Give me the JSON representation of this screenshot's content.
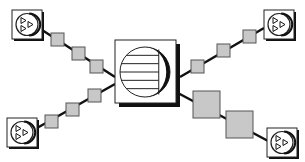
{
  "diagram": {
    "width": 305,
    "height": 162,
    "colors": {
      "background": "#ffffff",
      "line": "#111111",
      "square_fill": "#c8c8c8",
      "square_stroke": "#555555",
      "node_fill": "#ffffff",
      "node_stroke": "#222222",
      "shadow": "#111111"
    },
    "hub": {
      "name": "central-server",
      "icon": "striped-circle-icon",
      "x": 115,
      "y": 40,
      "w": 61,
      "h": 63,
      "shadow_offset": 4,
      "circle": {
        "cx": 145,
        "cy": 72,
        "r": 25
      },
      "stripes": 5
    },
    "nodes": [
      {
        "name": "node-top-left",
        "icon": "triangles-in-circle-icon",
        "x": 12,
        "y": 10,
        "w": 30,
        "h": 29
      },
      {
        "name": "node-top-right",
        "icon": "triangles-in-circle-icon",
        "x": 264,
        "y": 10,
        "w": 30,
        "h": 29
      },
      {
        "name": "node-bottom-left",
        "icon": "triangles-in-circle-icon",
        "x": 7,
        "y": 118,
        "w": 30,
        "h": 29
      },
      {
        "name": "node-bottom-right",
        "icon": "triangles-in-circle-icon",
        "x": 267,
        "y": 128,
        "w": 30,
        "h": 29
      }
    ],
    "links": [
      {
        "name": "link-top-left",
        "from": [
          42,
          30
        ],
        "to": [
          115,
          77
        ],
        "squares": [
          [
            51,
            33,
            13
          ],
          [
            72,
            47,
            13
          ],
          [
            90,
            60,
            13
          ]
        ]
      },
      {
        "name": "link-top-right",
        "from": [
          264,
          28
        ],
        "to": [
          180,
          77
        ],
        "squares": [
          [
            243,
            30,
            13
          ],
          [
            217,
            44,
            13
          ],
          [
            191,
            60,
            13
          ]
        ]
      },
      {
        "name": "link-bottom-left",
        "from": [
          37,
          128
        ],
        "to": [
          115,
          84
        ],
        "squares": [
          [
            45,
            115,
            13
          ],
          [
            66,
            103,
            13
          ],
          [
            88,
            89,
            13
          ]
        ]
      },
      {
        "name": "link-bottom-right",
        "from": [
          176,
          92
        ],
        "to": [
          270,
          142
        ],
        "squares": [
          [
            193,
            91,
            27
          ],
          [
            226,
            111,
            27
          ]
        ]
      }
    ]
  }
}
